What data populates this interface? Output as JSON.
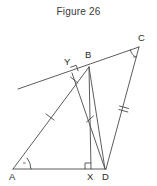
{
  "figure": {
    "title": "Figure 26",
    "stroke_color": "#4a4a4a",
    "label_color": "#2b2b2b",
    "background": "#ffffff",
    "width": 157,
    "height": 186,
    "vertices": [
      {
        "name": "A",
        "label": "A",
        "x": 13,
        "y": 169,
        "label_x": 9,
        "label_y": 172
      },
      {
        "name": "X",
        "label": "X",
        "x": 91,
        "y": 169,
        "label_x": 87,
        "label_y": 172
      },
      {
        "name": "D",
        "label": "D",
        "x": 105,
        "y": 169,
        "label_x": 102,
        "label_y": 172
      },
      {
        "name": "B",
        "label": "B",
        "x": 89,
        "y": 67,
        "label_x": 85,
        "label_y": 50
      },
      {
        "name": "Y",
        "label": "Y",
        "x": 72,
        "y": 73,
        "label_x": 64,
        "label_y": 57
      },
      {
        "name": "C",
        "label": "C",
        "x": 139,
        "y": 47,
        "label_x": 138,
        "label_y": 33
      }
    ],
    "angles": [
      {
        "name": "angle-at-a",
        "label": "α",
        "x": 23,
        "y": 162
      },
      {
        "name": "angle-at-c",
        "label": "α",
        "x": 133,
        "y": 56
      }
    ],
    "segments": [
      {
        "name": "segment-ad",
        "from": "A",
        "to": "D"
      },
      {
        "name": "segment-ab",
        "from": "A",
        "to": "B"
      },
      {
        "name": "segment-bx",
        "from": "B",
        "to": "X"
      },
      {
        "name": "segment-bd",
        "from": "B",
        "to": "D"
      },
      {
        "name": "segment-yd",
        "from": "Y",
        "to": "D"
      },
      {
        "name": "segment-cd",
        "from": "C",
        "to": "D"
      },
      {
        "name": "segment-transversal",
        "from": "line-left-end",
        "to": "C"
      }
    ],
    "tick_marks": [
      {
        "name": "tick-on-segment-ay",
        "count": 1,
        "x": 50,
        "y": 117
      },
      {
        "name": "tick-on-segment-yb",
        "count": 1,
        "x": 74,
        "y": 80
      },
      {
        "name": "tick-on-segment-bx",
        "count": 1,
        "x": 90,
        "y": 119
      },
      {
        "name": "tick-on-segment-cd",
        "count": 2,
        "x": 124,
        "y": 108
      }
    ],
    "right_angles": [
      {
        "name": "right-angle-at-x",
        "x": 91,
        "y": 169
      },
      {
        "name": "right-angle-at-y",
        "x": 72,
        "y": 73
      }
    ]
  }
}
